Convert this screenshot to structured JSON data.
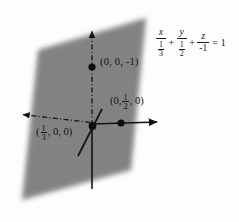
{
  "figure": {
    "background_color": "#fdfdfd",
    "plane": {
      "name": "shaded-plane",
      "fill_color": "#757575",
      "edge_blur": "soft",
      "corners": [
        [
          38,
          50
        ],
        [
          146,
          18
        ],
        [
          131,
          170
        ],
        [
          22,
          200
        ]
      ]
    },
    "axes": [
      {
        "name": "z-axis",
        "style": "dash-dot",
        "direction": "vertical-up",
        "arrow": true,
        "from": [
          92,
          125
        ],
        "to": [
          92,
          30
        ]
      },
      {
        "name": "z-axis-negative",
        "style": "solid",
        "direction": "vertical-down",
        "arrow": false,
        "from": [
          92,
          127
        ],
        "to": [
          92,
          189
        ]
      },
      {
        "name": "y-axis-negative",
        "style": "dash-dot",
        "direction": "horizontal-left",
        "arrow": true,
        "from": [
          92,
          122
        ],
        "to": [
          22,
          114
        ]
      },
      {
        "name": "y-axis-positive",
        "style": "solid",
        "direction": "horizontal-right",
        "arrow": true,
        "from": [
          92,
          124
        ],
        "to": [
          158,
          122
        ]
      },
      {
        "name": "x-axis",
        "style": "solid",
        "direction": "diagonal-down-left",
        "arrow": false,
        "from": [
          101,
          110
        ],
        "to": [
          78,
          155
        ]
      }
    ],
    "points": [
      {
        "name": "z-intercept-point",
        "coords_px": [
          92,
          67
        ],
        "label": "(0, 0, -1)",
        "label_kind": "plain"
      },
      {
        "name": "y-intercept-point",
        "coords_px": [
          121,
          123
        ],
        "label_prefix": "(0,",
        "label_fraction_num": "1",
        "label_fraction_den": "2",
        "label_suffix": ", 0)",
        "label_kind": "fraction"
      },
      {
        "name": "x-intercept-point",
        "coords_px": [
          92,
          126
        ],
        "label_prefix": "(",
        "label_fraction_num": "1",
        "label_fraction_den": "3",
        "label_suffix": ", 0, 0)",
        "label_kind": "fraction"
      }
    ]
  },
  "equation": {
    "name": "plane-equation",
    "terms": [
      {
        "numerator": "x",
        "denominator_whole": "1",
        "denominator_frac_num": "1",
        "denominator_frac_den": "3",
        "denominator_display": "1/3"
      },
      {
        "numerator": "y",
        "denominator_whole": "1",
        "denominator_frac_num": "1",
        "denominator_frac_den": "2",
        "denominator_display": "1/2"
      },
      {
        "numerator": "z",
        "denominator_whole": "-1",
        "denominator_display": "-1"
      }
    ],
    "operator": "+",
    "equals": "=",
    "right_side": "1",
    "plain_text": "x/(1/3) + y/(1/2) + z/(-1) = 1"
  },
  "colors": {
    "plane_gray": "#757575",
    "ink": "#121212",
    "paper": "#fdfdfd"
  }
}
